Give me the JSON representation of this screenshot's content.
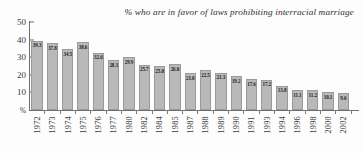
{
  "chart_data": {
    "type": "bar",
    "title": "% who are in favor of laws prohibiting interracial marriage",
    "xlabel": "",
    "ylabel": "%",
    "ylim": [
      0,
      50
    ],
    "yticks": [
      "50",
      "40",
      "30",
      "20",
      "10"
    ],
    "ytick_values": [
      50,
      40,
      30,
      20,
      10
    ],
    "baseline_label": "%",
    "grid": false,
    "legend": null,
    "categories": [
      "1972",
      "1973",
      "1974",
      "1975",
      "1976",
      "1977",
      "1980",
      "1982",
      "1984",
      "1985",
      "1987",
      "1988",
      "1989",
      "1990",
      "1991",
      "1993",
      "1994",
      "1996",
      "1998",
      "2000",
      "2002"
    ],
    "values": [
      39.3,
      37.8,
      34.5,
      38.6,
      32.6,
      28.3,
      29.9,
      25.7,
      25.0,
      26.0,
      21.0,
      22.5,
      21.3,
      19.2,
      17.6,
      17.2,
      13.8,
      11.1,
      11.2,
      10.1,
      9.6
    ],
    "value_labels": [
      "39.3",
      "37.8",
      "34.5",
      "38.6",
      "32.6",
      "28.3",
      "29.9",
      "25.7",
      "25.0",
      "26.0",
      "21.0",
      "22.5",
      "21.3",
      "19.2",
      "17.6",
      "17.2",
      "13.8",
      "11.1",
      "11.2",
      "10.1",
      "9.6"
    ],
    "bar_color": "#b9b9b9",
    "bar_border_color": "#9a9a9a",
    "axis_color": "#6f6f6f",
    "text_color": "#2d2d2d",
    "background_color": "#fdfdfd"
  }
}
